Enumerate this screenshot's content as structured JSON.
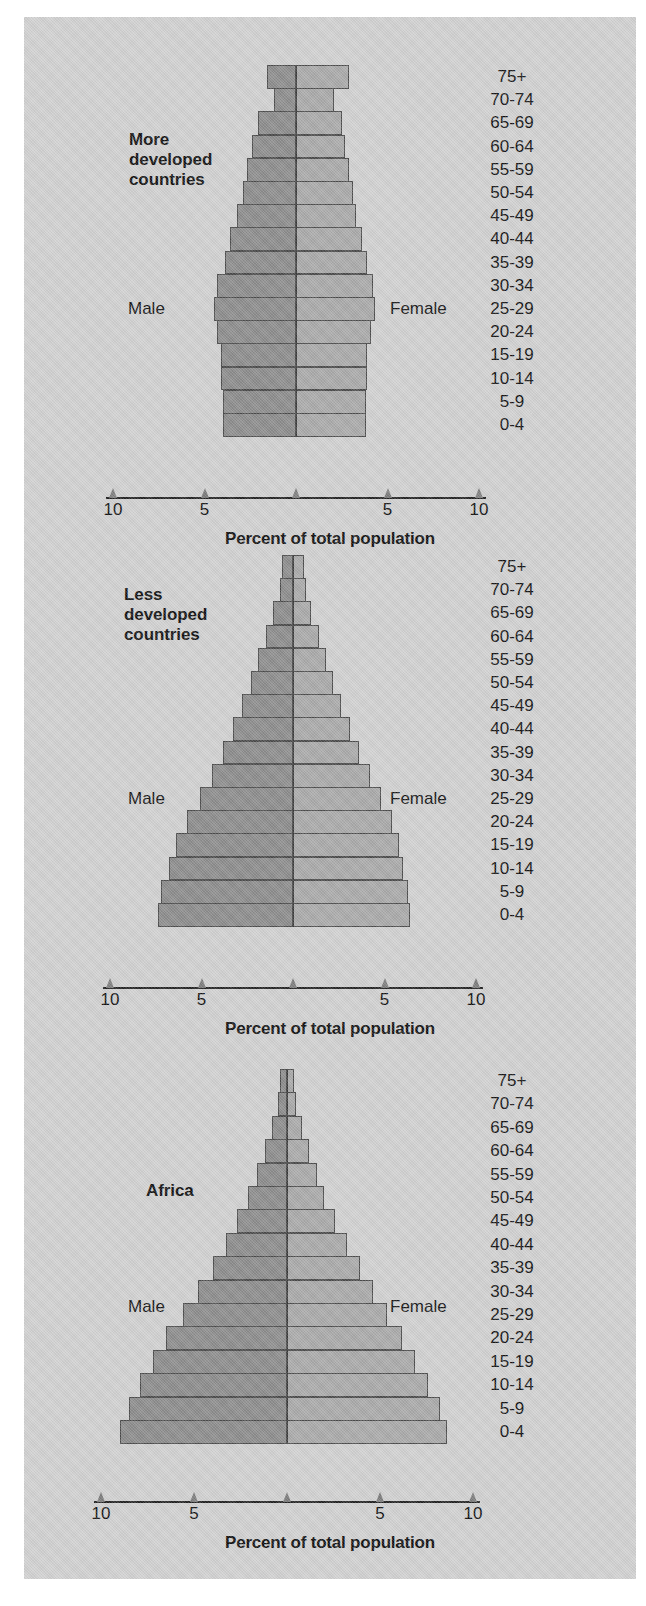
{
  "figure": {
    "background_color": "#d2d2d2",
    "male_color": "#8d8d8d",
    "female_color": "#aaaaaa",
    "axis_caption": "Percent of total population",
    "male_label": "Male",
    "female_label": "Female",
    "age_groups": [
      "75+",
      "70-74",
      "65-69",
      "60-64",
      "55-59",
      "50-54",
      "45-49",
      "40-44",
      "35-39",
      "30-34",
      "25-29",
      "20-24",
      "15-19",
      "10-14",
      "5-9",
      "0-4"
    ],
    "axis_tick_labels": [
      "10",
      "5",
      "",
      "5",
      "10"
    ],
    "axis_tick_values": [
      -10,
      -5,
      0,
      5,
      10
    ]
  },
  "panels": [
    {
      "title": "More\ndeveloped\ncountries",
      "title_lines": [
        "More",
        "developed",
        "countries"
      ]
    },
    {
      "title": "Less\ndeveloped\ncountries",
      "title_lines": [
        "Less",
        "developed",
        "countries"
      ]
    },
    {
      "title": "Africa",
      "title_lines": [
        "Africa"
      ]
    }
  ],
  "chart_data": [
    {
      "type": "bar",
      "chart_kind": "population-pyramid",
      "title": "More developed countries",
      "xlabel": "Percent of total population",
      "ylabel": "",
      "categories": [
        "75+",
        "70-74",
        "65-69",
        "60-64",
        "55-59",
        "50-54",
        "45-49",
        "40-44",
        "35-39",
        "30-34",
        "25-29",
        "20-24",
        "15-19",
        "10-14",
        "5-9",
        "0-4"
      ],
      "series": [
        {
          "name": "Male",
          "side": "left",
          "values": [
            1.6,
            1.2,
            2.1,
            2.4,
            2.7,
            2.9,
            3.2,
            3.6,
            3.9,
            4.3,
            4.5,
            4.3,
            4.1,
            4.1,
            4.0,
            4.0
          ]
        },
        {
          "name": "Female",
          "side": "right",
          "values": [
            2.9,
            2.1,
            2.5,
            2.7,
            2.9,
            3.1,
            3.3,
            3.6,
            3.9,
            4.2,
            4.3,
            4.1,
            3.9,
            3.9,
            3.8,
            3.8
          ]
        }
      ],
      "xlim": [
        -10,
        10
      ],
      "xticks": [
        -10,
        -5,
        0,
        5,
        10
      ],
      "xticklabels": [
        "10",
        "5",
        "",
        "5",
        "10"
      ],
      "grid": false,
      "legend": [
        "Male",
        "Female"
      ],
      "legend_position": "inline-sides",
      "annotations": [
        "Male",
        "Female"
      ]
    },
    {
      "type": "bar",
      "chart_kind": "population-pyramid",
      "title": "Less developed countries",
      "xlabel": "Percent of total population",
      "ylabel": "",
      "categories": [
        "75+",
        "70-74",
        "65-69",
        "60-64",
        "55-59",
        "50-54",
        "45-49",
        "40-44",
        "35-39",
        "30-34",
        "25-29",
        "20-24",
        "15-19",
        "10-14",
        "5-9",
        "0-4"
      ],
      "series": [
        {
          "name": "Male",
          "side": "left",
          "values": [
            0.6,
            0.7,
            1.1,
            1.5,
            1.9,
            2.3,
            2.8,
            3.3,
            3.8,
            4.4,
            5.1,
            5.8,
            6.4,
            6.8,
            7.2,
            7.4
          ]
        },
        {
          "name": "Female",
          "side": "right",
          "values": [
            0.6,
            0.7,
            1.0,
            1.4,
            1.8,
            2.2,
            2.6,
            3.1,
            3.6,
            4.2,
            4.8,
            5.4,
            5.8,
            6.0,
            6.3,
            6.4
          ]
        }
      ],
      "xlim": [
        -10,
        10
      ],
      "xticks": [
        -10,
        -5,
        0,
        5,
        10
      ],
      "xticklabels": [
        "10",
        "5",
        "",
        "5",
        "10"
      ],
      "grid": false,
      "legend": [
        "Male",
        "Female"
      ],
      "legend_position": "inline-sides",
      "annotations": [
        "Male",
        "Female"
      ]
    },
    {
      "type": "bar",
      "chart_kind": "population-pyramid",
      "title": "Africa",
      "xlabel": "Percent of total population",
      "ylabel": "",
      "categories": [
        "75+",
        "70-74",
        "65-69",
        "60-64",
        "55-59",
        "50-54",
        "45-49",
        "40-44",
        "35-39",
        "30-34",
        "25-29",
        "20-24",
        "15-19",
        "10-14",
        "5-9",
        "0-4"
      ],
      "series": [
        {
          "name": "Male",
          "side": "left",
          "values": [
            0.4,
            0.5,
            0.8,
            1.2,
            1.6,
            2.1,
            2.7,
            3.3,
            4.0,
            4.8,
            5.6,
            6.5,
            7.2,
            7.9,
            8.5,
            9.0
          ]
        },
        {
          "name": "Female",
          "side": "right",
          "values": [
            0.4,
            0.5,
            0.8,
            1.2,
            1.6,
            2.0,
            2.6,
            3.2,
            3.9,
            4.6,
            5.4,
            6.2,
            6.9,
            7.6,
            8.2,
            8.6
          ]
        }
      ],
      "xlim": [
        -10,
        10
      ],
      "xticks": [
        -10,
        -5,
        0,
        5,
        10
      ],
      "xticklabels": [
        "10",
        "5",
        "",
        "5",
        "10"
      ],
      "grid": false,
      "legend": [
        "Male",
        "Female"
      ],
      "legend_position": "inline-sides",
      "annotations": [
        "Male",
        "Female"
      ]
    }
  ]
}
